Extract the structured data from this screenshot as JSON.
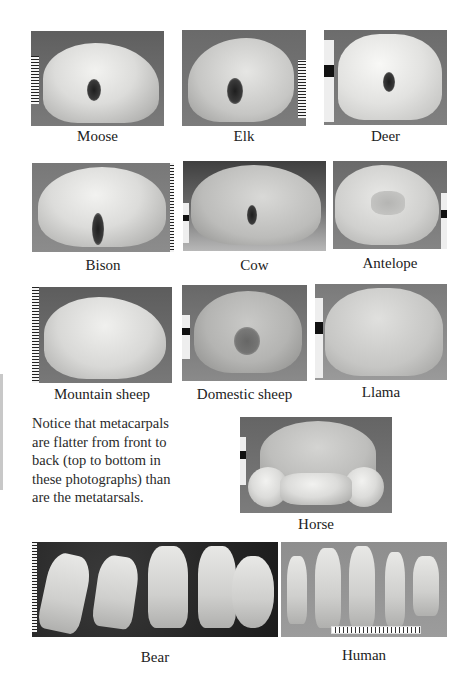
{
  "figures": [
    {
      "id": "moose",
      "caption": "Moose"
    },
    {
      "id": "elk",
      "caption": "Elk"
    },
    {
      "id": "deer",
      "caption": "Deer"
    },
    {
      "id": "bison",
      "caption": "Bison"
    },
    {
      "id": "cow",
      "caption": "Cow"
    },
    {
      "id": "antelope",
      "caption": "Antelope"
    },
    {
      "id": "mountain-sheep",
      "caption": "Mountain sheep"
    },
    {
      "id": "domestic-sheep",
      "caption": "Domestic sheep"
    },
    {
      "id": "llama",
      "caption": "Llama"
    },
    {
      "id": "horse",
      "caption": "Horse"
    },
    {
      "id": "bear",
      "caption": "Bear"
    },
    {
      "id": "human",
      "caption": "Human"
    }
  ],
  "note": {
    "text": "Notice that metacarpals are flatter from front to back (top to bottom in these photographs) than are the metatarsals."
  }
}
